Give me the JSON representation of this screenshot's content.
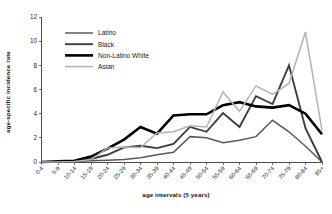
{
  "chart_data": {
    "type": "line",
    "title": "",
    "xlabel": "age intervals (5 years)",
    "ylabel": "age-specific incidence rate",
    "ylim": [
      0,
      12
    ],
    "yticks": [
      0,
      2,
      4,
      6,
      8,
      10,
      12
    ],
    "grid": false,
    "legend_position": "upper-left-inside",
    "categories": [
      "0-4",
      "5-9",
      "10-14",
      "15-19",
      "20-24",
      "25-29",
      "30-34",
      "35-39",
      "40-44",
      "45-49",
      "50-54",
      "55-59",
      "60-64",
      "65-69",
      "70-74",
      "75-79",
      "80-84",
      "85+"
    ],
    "series": [
      {
        "name": "Latino",
        "color": "#595959",
        "width": 1.5,
        "values": [
          0,
          0,
          0.05,
          0.1,
          0.15,
          0.2,
          0.35,
          0.6,
          0.8,
          2.1,
          2.0,
          1.6,
          1.8,
          2.1,
          3.45,
          2.5,
          1.3,
          0
        ]
      },
      {
        "name": "Black",
        "color": "#3d3d3d",
        "width": 1.9,
        "values": [
          0,
          0,
          0.05,
          0.25,
          0.6,
          1.2,
          1.35,
          1.15,
          1.5,
          2.9,
          2.5,
          4.05,
          2.9,
          5.45,
          4.8,
          8.0,
          2.8,
          0
        ]
      },
      {
        "name": "Non-Latino White",
        "color": "#000000",
        "width": 2.6,
        "values": [
          0,
          0.05,
          0.1,
          0.45,
          1.1,
          1.85,
          2.9,
          2.35,
          3.85,
          3.95,
          3.95,
          4.7,
          4.95,
          4.6,
          4.5,
          4.7,
          4.0,
          2.3
        ]
      },
      {
        "name": "Asian",
        "color": "#b3b3b3",
        "width": 1.5,
        "values": [
          0,
          0,
          0.05,
          0.2,
          1.15,
          1.25,
          1.2,
          2.4,
          2.5,
          3.0,
          2.9,
          5.8,
          4.2,
          6.3,
          5.6,
          6.5,
          10.75,
          2.6
        ]
      }
    ]
  }
}
